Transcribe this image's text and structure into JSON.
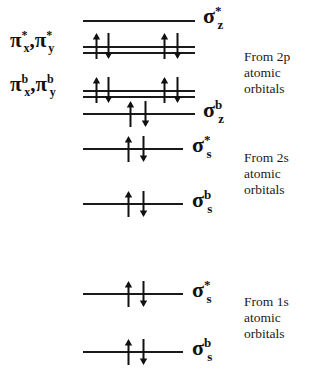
{
  "figure": {
    "line_color": "#1a1a1a",
    "background": "#ffffff"
  },
  "levels": [
    {
      "id": "sigma-star-z",
      "symbol": "σ",
      "superscript": "*",
      "subscript": "z",
      "label_text": "σ*z",
      "style": "single",
      "electrons": 0,
      "origin_shell": "2p"
    },
    {
      "id": "pi-star-xy",
      "symbol": "π",
      "superscript": "*",
      "subscript": "x,y",
      "label_text": "π*x, π*y",
      "style": "doubled",
      "electrons": 4,
      "origin_shell": "2p"
    },
    {
      "id": "pi-bonding-xy",
      "symbol": "π",
      "superscript": "b",
      "subscript": "x,y",
      "label_text": "πbx, πby",
      "style": "doubled",
      "electrons": 4,
      "origin_shell": "2p"
    },
    {
      "id": "sigma-bonding-z",
      "symbol": "σ",
      "superscript": "b",
      "subscript": "z",
      "label_text": "σbz",
      "style": "single",
      "electrons": 2,
      "origin_shell": "2p"
    },
    {
      "id": "sigma-star-s-2s",
      "symbol": "σ",
      "superscript": "*",
      "subscript": "s",
      "label_text": "σ*s",
      "style": "single",
      "electrons": 2,
      "origin_shell": "2s"
    },
    {
      "id": "sigma-bonding-s-2s",
      "symbol": "σ",
      "superscript": "b",
      "subscript": "s",
      "label_text": "σbs",
      "style": "single",
      "electrons": 2,
      "origin_shell": "2s"
    },
    {
      "id": "sigma-star-s-1s",
      "symbol": "σ",
      "superscript": "*",
      "subscript": "s",
      "label_text": "σ*s",
      "style": "single",
      "electrons": 2,
      "origin_shell": "1s"
    },
    {
      "id": "sigma-bonding-s-1s",
      "symbol": "σ",
      "superscript": "b",
      "subscript": "s",
      "label_text": "σbs",
      "style": "single",
      "electrons": 2,
      "origin_shell": "1s"
    }
  ],
  "pi_labels": {
    "antibonding": {
      "pi": "π",
      "sup": "*",
      "sub_x": "x",
      "sub_y": "y",
      "comma": ","
    },
    "bonding": {
      "pi": "π",
      "sup": "b",
      "sub_x": "x",
      "sub_y": "y",
      "comma": ","
    }
  },
  "sigma_symbols": {
    "sigma": "σ",
    "star": "*",
    "bonding": "b",
    "sub_z": "z",
    "sub_s": "s"
  },
  "origins": [
    {
      "id": "origin-2p",
      "line1": "From 2p",
      "line2": "atomic",
      "line3": "orbitals"
    },
    {
      "id": "origin-2s",
      "line1": "From 2s",
      "line2": "atomic",
      "line3": "orbitals"
    },
    {
      "id": "origin-1s",
      "line1": "From 1s",
      "line2": "atomic",
      "line3": "orbitals"
    }
  ]
}
